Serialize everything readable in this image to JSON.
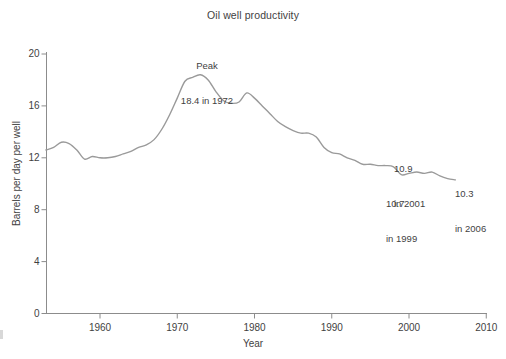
{
  "chart_data": {
    "type": "line",
    "title": "Oil well productivity",
    "xlabel": "Year",
    "ylabel": "Barrels per day per well",
    "xlim": [
      1953,
      2010
    ],
    "ylim": [
      0,
      20
    ],
    "xticks": [
      "1960",
      "1970",
      "1980",
      "1990",
      "2000",
      "2010"
    ],
    "xtick_values": [
      1960,
      1970,
      1980,
      1990,
      2000,
      2010
    ],
    "yticks": [
      "0",
      "4",
      "8",
      "12",
      "16",
      "20"
    ],
    "ytick_values": [
      0,
      4,
      8,
      12,
      16,
      20
    ],
    "grid": false,
    "legend": "none",
    "line_color": "#9a9a9a",
    "axis_color": "#8c8c8c",
    "x": [
      1953,
      1954,
      1955,
      1956,
      1957,
      1958,
      1959,
      1960,
      1961,
      1962,
      1963,
      1964,
      1965,
      1966,
      1967,
      1968,
      1969,
      1970,
      1971,
      1972,
      1973,
      1974,
      1975,
      1976,
      1977,
      1978,
      1979,
      1980,
      1981,
      1982,
      1983,
      1984,
      1985,
      1986,
      1987,
      1988,
      1989,
      1990,
      1991,
      1992,
      1993,
      1994,
      1995,
      1996,
      1997,
      1998,
      1999,
      2000,
      2001,
      2002,
      2003,
      2004,
      2005,
      2006
    ],
    "values": [
      12.6,
      12.8,
      13.2,
      13.1,
      12.6,
      11.9,
      12.1,
      12.0,
      12.0,
      12.1,
      12.3,
      12.5,
      12.8,
      13.0,
      13.4,
      14.2,
      15.3,
      16.6,
      17.9,
      18.2,
      18.4,
      18.0,
      17.1,
      16.4,
      16.2,
      16.3,
      17.0,
      16.6,
      16.0,
      15.4,
      14.8,
      14.4,
      14.1,
      13.9,
      13.9,
      13.6,
      12.8,
      12.4,
      12.3,
      12.0,
      11.8,
      11.5,
      11.5,
      11.4,
      11.4,
      11.3,
      10.7,
      10.8,
      10.9,
      10.8,
      10.9,
      10.6,
      10.4,
      10.3
    ],
    "annotations": [
      {
        "id": "peak",
        "text": "Peak\n18.4 in 1972",
        "line1": "Peak",
        "line2": "18.4 in 1972",
        "at_x": 1972,
        "at_y": 18.4
      },
      {
        "id": "y2001",
        "text": "10.9\nin 2001",
        "line1": "10.9",
        "line2": "in 2001",
        "at_x": 2001,
        "at_y": 10.9
      },
      {
        "id": "y1999",
        "text": "10.7\nin 1999",
        "line1": "10.7",
        "line2": "in 1999",
        "at_x": 1999,
        "at_y": 10.7
      },
      {
        "id": "y2006",
        "text": "10.3\nin 2006",
        "line1": "10.3",
        "line2": "in 2006",
        "at_x": 2006,
        "at_y": 10.3
      }
    ]
  },
  "chart": {
    "title": "Oil well productivity",
    "xlabel": "Year",
    "ylabel": "Barrels per day per well",
    "xticks": [
      "1960",
      "1970",
      "1980",
      "1990",
      "2000",
      "2010"
    ],
    "yticks": [
      "20",
      "16",
      "12",
      "8",
      "4",
      "0"
    ],
    "annotations": {
      "peak_line1": "Peak",
      "peak_line2": "18.4 in 1972",
      "a2001_line1": "10.9",
      "a2001_line2": "in 2001",
      "a1999_line1": "10.7",
      "a1999_line2": "in 1999",
      "a2006_line1": "10.3",
      "a2006_line2": "in 2006"
    }
  }
}
